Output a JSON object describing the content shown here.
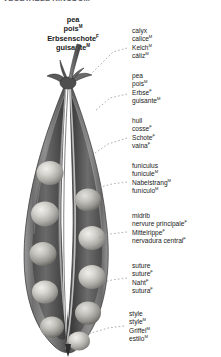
{
  "page": {
    "header": "VEGETABLE KINGDOM",
    "background_color": "#ffffff",
    "text_color": "#1a1a1a"
  },
  "plate_title": {
    "terms": [
      {
        "text": "pea",
        "gender": ""
      },
      {
        "text": "pois",
        "gender": "M"
      },
      {
        "text": "Erbsenschote",
        "gender": "F"
      },
      {
        "text": "guisante",
        "gender": "M"
      }
    ]
  },
  "callouts": [
    {
      "id": "calyx",
      "name": "calyx",
      "terms": [
        {
          "text": "calyx",
          "gender": ""
        },
        {
          "text": "calice",
          "gender": "M"
        },
        {
          "text": "Kelch",
          "gender": "M"
        },
        {
          "text": "cáliz",
          "gender": "M"
        }
      ]
    },
    {
      "id": "pea",
      "name": "pea",
      "terms": [
        {
          "text": "pea",
          "gender": ""
        },
        {
          "text": "pois",
          "gender": "M"
        },
        {
          "text": "Erbse",
          "gender": "F"
        },
        {
          "text": "guisante",
          "gender": "M"
        }
      ]
    },
    {
      "id": "hull",
      "name": "hull",
      "terms": [
        {
          "text": "hull",
          "gender": ""
        },
        {
          "text": "cosse",
          "gender": "F"
        },
        {
          "text": "Schote",
          "gender": "F"
        },
        {
          "text": "vaina",
          "gender": "F"
        }
      ]
    },
    {
      "id": "funiculus",
      "name": "funiculus",
      "terms": [
        {
          "text": "funiculus",
          "gender": ""
        },
        {
          "text": "funicule",
          "gender": "M"
        },
        {
          "text": "Nabelstrang",
          "gender": "M"
        },
        {
          "text": "funículo",
          "gender": "M"
        }
      ]
    },
    {
      "id": "midrib",
      "name": "midrib",
      "terms": [
        {
          "text": "midrib",
          "gender": ""
        },
        {
          "text": "nervure principale",
          "gender": "F"
        },
        {
          "text": "Mittelrippe",
          "gender": "F"
        },
        {
          "text": "nervadura central",
          "gender": "F"
        }
      ]
    },
    {
      "id": "suture",
      "name": "suture",
      "terms": [
        {
          "text": "suture",
          "gender": ""
        },
        {
          "text": "suture",
          "gender": "F"
        },
        {
          "text": "Naht",
          "gender": "F"
        },
        {
          "text": "sutura",
          "gender": "F"
        }
      ]
    },
    {
      "id": "style",
      "name": "style",
      "terms": [
        {
          "text": "style",
          "gender": ""
        },
        {
          "text": "style",
          "gender": "M"
        },
        {
          "text": "Griffel",
          "gender": "M"
        },
        {
          "text": "estilo",
          "gender": "M"
        }
      ]
    }
  ],
  "illustration": {
    "name": "pea-pod-split-open",
    "description": "Grayscale botanical illustration of a pea pod split lengthwise into two halves, each half holding a row of round peas, with calyx and stem at the top and a pointed style at the bottom tip.",
    "pea_count_left": 5,
    "pea_count_right": 5,
    "colors": {
      "pod_outer": "#6e6e6e",
      "pod_inner": "#8d8d8d",
      "pod_shadow": "#3d3d3d",
      "pea_light": "#d8d8d4",
      "pea_mid": "#a9a9a5",
      "cavity": "#4a4a4a",
      "leader_line": "#8a8a8a"
    }
  }
}
